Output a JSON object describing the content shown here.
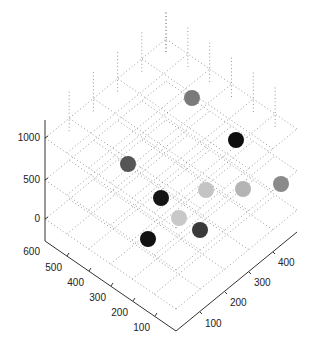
{
  "chart_data": {
    "type": "scatter",
    "dimensions": 3,
    "title": "",
    "xlabel": "",
    "ylabel": "",
    "zlabel": "",
    "x_ticks": [
      100,
      200,
      300,
      400
    ],
    "y_ticks": [
      100,
      200,
      300,
      400,
      500,
      600
    ],
    "z_ticks": [
      0,
      500,
      1000
    ],
    "xlim": [
      0,
      500
    ],
    "ylim": [
      0,
      600
    ],
    "zlim": [
      -200,
      1200
    ],
    "grid": true,
    "legend": null,
    "points": [
      {
        "x": 100,
        "y": 500,
        "z": 1000,
        "color": "#7a7a7a"
      },
      {
        "x": 300,
        "y": 400,
        "z": 1000,
        "color": "#0e0e0e"
      },
      {
        "x": 100,
        "y": 500,
        "z": 500,
        "color": "#555555"
      },
      {
        "x": 200,
        "y": 300,
        "z": 500,
        "color": "#151515"
      },
      {
        "x": 300,
        "y": 200,
        "z": 500,
        "color": "#c4c4c4"
      },
      {
        "x": 400,
        "y": 100,
        "z": 500,
        "color": "#b4b4b4"
      },
      {
        "x": 500,
        "y": 100,
        "z": 500,
        "color": "#8a8a8a"
      },
      {
        "x": 200,
        "y": 200,
        "z": 0,
        "color": "#c8c8c8"
      },
      {
        "x": 300,
        "y": 100,
        "z": 0,
        "color": "#3a3a3a"
      },
      {
        "x": 100,
        "y": 300,
        "z": 0,
        "color": "#111111"
      }
    ],
    "screen_points": [
      {
        "cx": 192,
        "cy": 98,
        "color": "#7a7a7a"
      },
      {
        "cx": 236,
        "cy": 140,
        "color": "#0e0e0e"
      },
      {
        "cx": 128,
        "cy": 164,
        "color": "#555555"
      },
      {
        "cx": 161,
        "cy": 198,
        "color": "#151515"
      },
      {
        "cx": 206,
        "cy": 190,
        "color": "#c4c4c4"
      },
      {
        "cx": 243,
        "cy": 189,
        "color": "#b4b4b4"
      },
      {
        "cx": 281,
        "cy": 184,
        "color": "#8a8a8a"
      },
      {
        "cx": 179,
        "cy": 218,
        "color": "#c8c8c8"
      },
      {
        "cx": 200,
        "cy": 230,
        "color": "#3a3a3a"
      },
      {
        "cx": 148,
        "cy": 239,
        "color": "#111111"
      }
    ]
  },
  "axes": {
    "z_tick_labels": [
      "1000",
      "500",
      "0"
    ],
    "y_tick_labels": [
      "600",
      "500",
      "400",
      "300",
      "200",
      "100"
    ],
    "x_tick_labels": [
      "100",
      "200",
      "300",
      "400"
    ]
  }
}
